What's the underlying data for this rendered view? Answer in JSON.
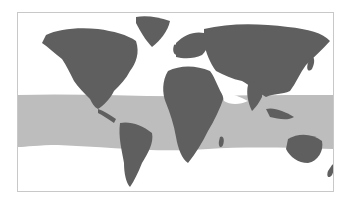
{
  "map": {
    "type": "world-map",
    "projection": "equirectangular-like",
    "highlight": {
      "name": "tropical-band",
      "description": "shaded band between tropics",
      "color": "#bdbdbd"
    },
    "land_color": "#5f5f5f",
    "ocean_color": "#ffffff",
    "border_color": "#c8c8c8"
  }
}
